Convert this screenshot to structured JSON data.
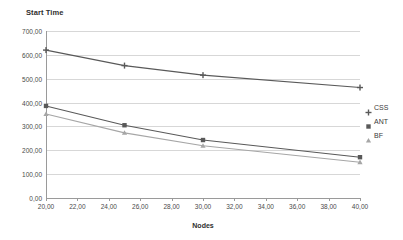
{
  "chart_data": {
    "type": "line",
    "title": "Start Time",
    "xlabel": "Nodes",
    "ylabel": "",
    "xlim": [
      20,
      40
    ],
    "ylim": [
      0,
      700
    ],
    "grid": true,
    "legend_position": "right",
    "x": [
      20,
      25,
      30,
      40
    ],
    "x_tick_labels": [
      "20,00",
      "22,00",
      "24,00",
      "26,00",
      "28,00",
      "30,00",
      "32,00",
      "34,00",
      "36,00",
      "38,00",
      "40,00"
    ],
    "x_tick_values": [
      20,
      22,
      24,
      26,
      28,
      30,
      32,
      34,
      36,
      38,
      40
    ],
    "y_tick_labels": [
      "0,00",
      "100,00",
      "200,00",
      "300,00",
      "400,00",
      "500,00",
      "600,00",
      "700,00"
    ],
    "y_tick_values": [
      0,
      100,
      200,
      300,
      400,
      500,
      600,
      700
    ],
    "series": [
      {
        "name": "CSS",
        "marker": "plus",
        "color": "#595959",
        "values": [
          620,
          555,
          515,
          463
        ]
      },
      {
        "name": "ANT",
        "marker": "square",
        "color": "#595959",
        "values": [
          386,
          305,
          243,
          171
        ]
      },
      {
        "name": "BF",
        "marker": "triangle",
        "color": "#a6a6a6",
        "values": [
          352,
          273,
          219,
          150
        ]
      }
    ]
  },
  "legend": {
    "items": [
      {
        "label": "CSS",
        "marker": "plus"
      },
      {
        "label": "ANT",
        "marker": "square"
      },
      {
        "label": "BF",
        "marker": "triangle"
      }
    ]
  },
  "colors": {
    "gridline": "#d7d7d7",
    "axis": "#9a9a9a",
    "text": "#3a3a3a",
    "series_dark": "#595959",
    "series_light": "#a6a6a6"
  }
}
